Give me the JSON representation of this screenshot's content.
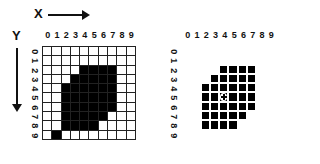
{
  "axes": {
    "x_label": "X",
    "y_label": "Y"
  },
  "column_labels": [
    "0",
    "1",
    "2",
    "3",
    "4",
    "5",
    "6",
    "7",
    "8",
    "9"
  ],
  "row_labels": [
    "0",
    "1",
    "2",
    "3",
    "4",
    "5",
    "6",
    "7",
    "8",
    "9"
  ],
  "left_grid": {
    "description": "binary image on 10x10 pixel grid",
    "filled": {
      "2": [
        4,
        5,
        6,
        7
      ],
      "3": [
        3,
        4,
        5,
        6,
        7
      ],
      "4": [
        2,
        3,
        4,
        5,
        6,
        7
      ],
      "5": [
        2,
        3,
        4,
        5,
        6,
        7
      ],
      "6": [
        2,
        3,
        4,
        5,
        6,
        7
      ],
      "7": [
        2,
        3,
        4,
        5,
        6
      ],
      "8": [
        2,
        3,
        4,
        5
      ],
      "9": [
        1
      ]
    }
  },
  "right_grid": {
    "description": "region pixels with centroid marker",
    "filled": {
      "2": [
        4,
        5,
        6,
        7
      ],
      "3": [
        3,
        4,
        5,
        6,
        7
      ],
      "4": [
        2,
        3,
        4,
        5,
        6,
        7
      ],
      "5": [
        2,
        3,
        4,
        5,
        6,
        7
      ],
      "6": [
        2,
        3,
        4,
        5,
        6,
        7
      ],
      "7": [
        2,
        3,
        4,
        5,
        6
      ],
      "8": [
        2,
        3,
        4,
        5
      ]
    },
    "centroid": {
      "row": 5,
      "col": 4,
      "icon": "crosshair-circle-icon"
    }
  }
}
